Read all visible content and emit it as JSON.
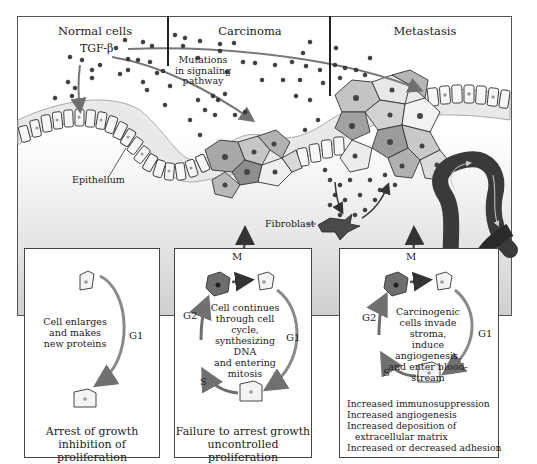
{
  "panels": [
    {
      "title": "Normal cells"
    },
    {
      "title": "Carcinoma"
    },
    {
      "title": "Metastasis"
    }
  ],
  "annotations": {
    "tgf_beta": "TGF-β",
    "mutations": [
      "Mutations",
      "in signaling",
      "pathway"
    ],
    "epithelium": "Epithelium",
    "fibroblast": "Fibroblast"
  },
  "boxes": [
    {
      "center_text": [
        "Cell enlarges",
        "and makes",
        "new proteins"
      ],
      "phases": {
        "g1": "G1"
      },
      "caption": [
        "Arrest of growth",
        "inhibition of proliferation"
      ]
    },
    {
      "center_text": [
        "Cell continues",
        "through cell cycle,",
        "synthesizing DNA",
        "and entering",
        "mitosis"
      ],
      "phases": {
        "m": "M",
        "g1": "G1",
        "g2": "G2",
        "s": "S"
      },
      "caption": [
        "Failure to arrest growth",
        "uncontrolled proliferation"
      ]
    },
    {
      "center_text": [
        "Carcinogenic",
        "cells invade stroma,",
        "induce angiogenesis,",
        "and enter blood-",
        "stream"
      ],
      "phases": {
        "m": "M",
        "g1": "G1",
        "g2": "G2",
        "s": "S"
      },
      "list": [
        "Increased immunosuppression",
        "Increased angiogenesis",
        "Increased deposition of",
        "  extracellular matrix",
        "Increased or decreased adhesion"
      ]
    }
  ],
  "colors": {
    "frame_border": "#555555",
    "divider": "#222222",
    "arrow": "#707070",
    "dividing_cell": "#6e6e6e",
    "blood_vessel": "#3a3a3a",
    "dots": "#3c3c3c"
  }
}
